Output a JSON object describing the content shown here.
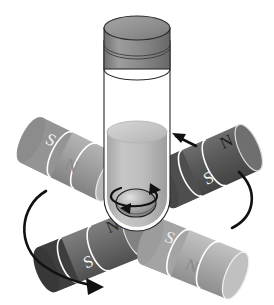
{
  "figure": {
    "background_color": "#ffffff"
  },
  "vial": {
    "name": "sample vial",
    "cap": {
      "label": "cap",
      "fill": "#8c8c8c",
      "top_fill": "#9a9a9a",
      "stroke": "#2b2b2b"
    },
    "body": {
      "label": "glass body",
      "fill": "#ffffff",
      "stroke": "#3a3a3a"
    },
    "liquid": {
      "label": "liquid",
      "surface_fill": "#c9c9c9",
      "fill": "#b8b8b8"
    },
    "stir_bar": {
      "label": "magnetic stir bar",
      "fill": "#9e9e9e",
      "stroke": "#1a1a1a"
    },
    "stir_arrow": {
      "label": "stir bar rotation arrow",
      "direction": "clockwise"
    }
  },
  "magnets": [
    {
      "id": "magnet-upper-left",
      "position": "upper-left",
      "body_fill": "#9d9d9d",
      "cap_fill": "#8a8a8a",
      "end_fill": "#b0b0b0",
      "poles": [
        {
          "label": "S",
          "segment": "near-end"
        },
        {
          "label": "N",
          "segment": "far-end"
        }
      ]
    },
    {
      "id": "magnet-upper-right",
      "position": "upper-right",
      "body_fill": "#5c5c5c",
      "cap_fill": "#4a4a4a",
      "end_fill": "#6d6d6d",
      "poles": [
        {
          "label": "S",
          "segment": "near-end"
        },
        {
          "label": "N",
          "segment": "far-end"
        }
      ]
    },
    {
      "id": "magnet-lower-left",
      "position": "lower-left",
      "body_fill": "#6a6a6a",
      "cap_fill": "#3f3f3f",
      "end_fill": "#7d7d7d",
      "poles": [
        {
          "label": "S",
          "segment": "near-end"
        },
        {
          "label": "N",
          "segment": "far-end"
        }
      ]
    },
    {
      "id": "magnet-lower-right",
      "position": "lower-right",
      "body_fill": "#a8a8a8",
      "cap_fill": "#9a9a9a",
      "end_fill": "#bdbdbd",
      "poles": [
        {
          "label": "S",
          "segment": "near-end"
        },
        {
          "label": "N",
          "segment": "far-end"
        }
      ]
    }
  ],
  "arrows": [
    {
      "id": "arrow-upper-right",
      "label": "upward-left direction arrow",
      "kind": "straight"
    },
    {
      "id": "arrow-right-curve",
      "label": "right magnet rotation arc",
      "kind": "arc"
    },
    {
      "id": "arrow-left-curve",
      "label": "left magnet rotation arc",
      "kind": "arc-with-head"
    },
    {
      "id": "arrow-bottom-left",
      "label": "bottom-left rotation arrowhead",
      "kind": "head"
    }
  ],
  "labels": {
    "south": "S",
    "north": "N"
  }
}
